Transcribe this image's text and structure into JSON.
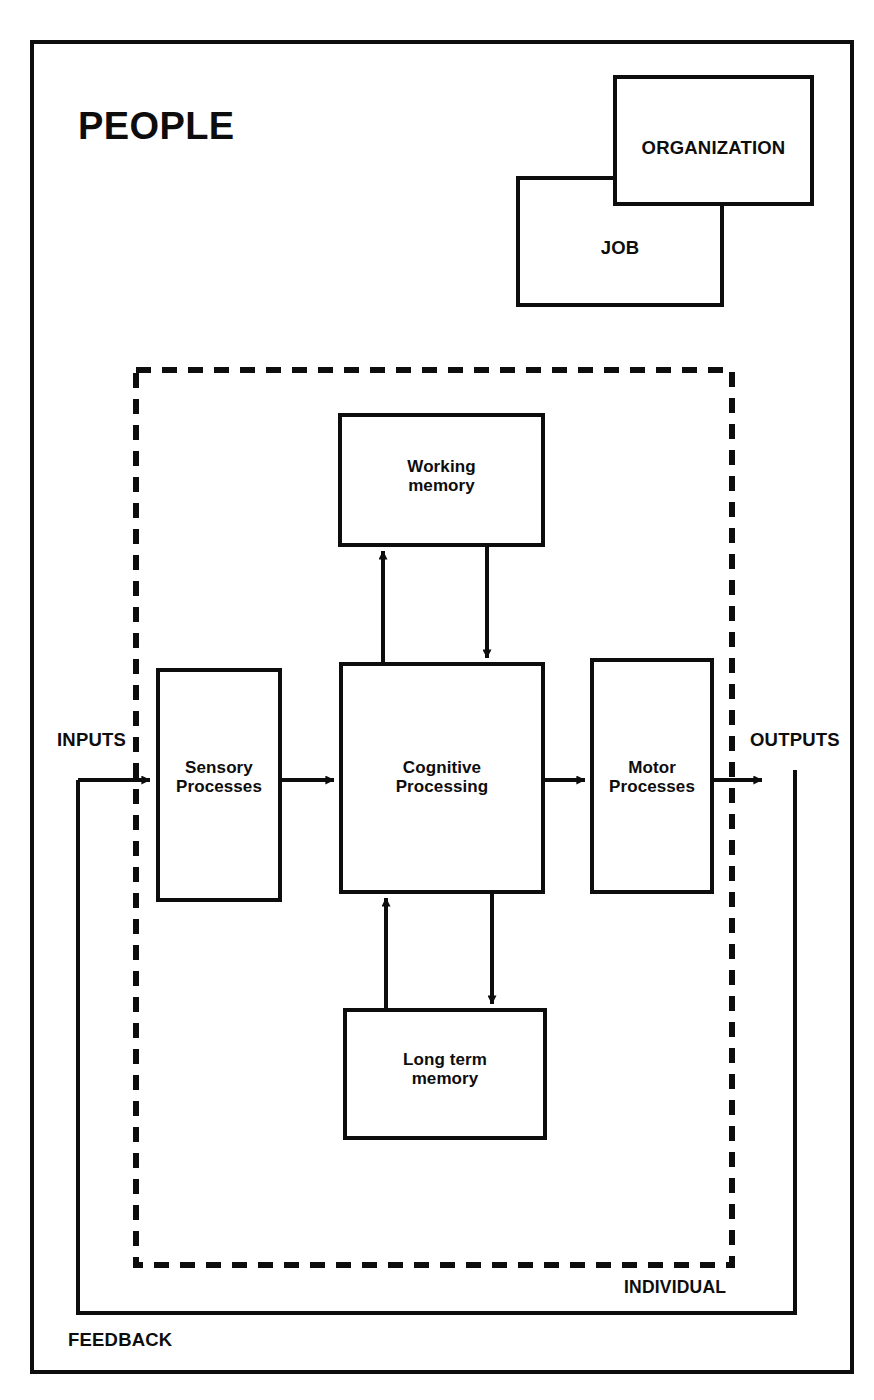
{
  "diagram": {
    "title": "PEOPLE",
    "outer_frame_label": "PEOPLE",
    "context_boxes": [
      {
        "id": "organization",
        "label": "ORGANIZATION"
      },
      {
        "id": "job",
        "label": "JOB"
      }
    ],
    "boundary": {
      "style": "dashed",
      "label": "INDIVIDUAL"
    },
    "process_boxes": [
      {
        "id": "working-memory",
        "label": "Working\nmemory"
      },
      {
        "id": "sensory-processes",
        "label": "Sensory\nProcesses"
      },
      {
        "id": "cognitive-processing",
        "label": "Cognitive\nProcessing"
      },
      {
        "id": "motor-processes",
        "label": "Motor\nProcesses"
      },
      {
        "id": "long-term-memory",
        "label": "Long term\nmemory"
      }
    ],
    "flow_labels": {
      "inputs": "INPUTS",
      "outputs": "OUTPUTS",
      "feedback": "FEEDBACK"
    },
    "colors": {
      "ink": "#0d0d0d",
      "background": "#ffffff"
    }
  }
}
